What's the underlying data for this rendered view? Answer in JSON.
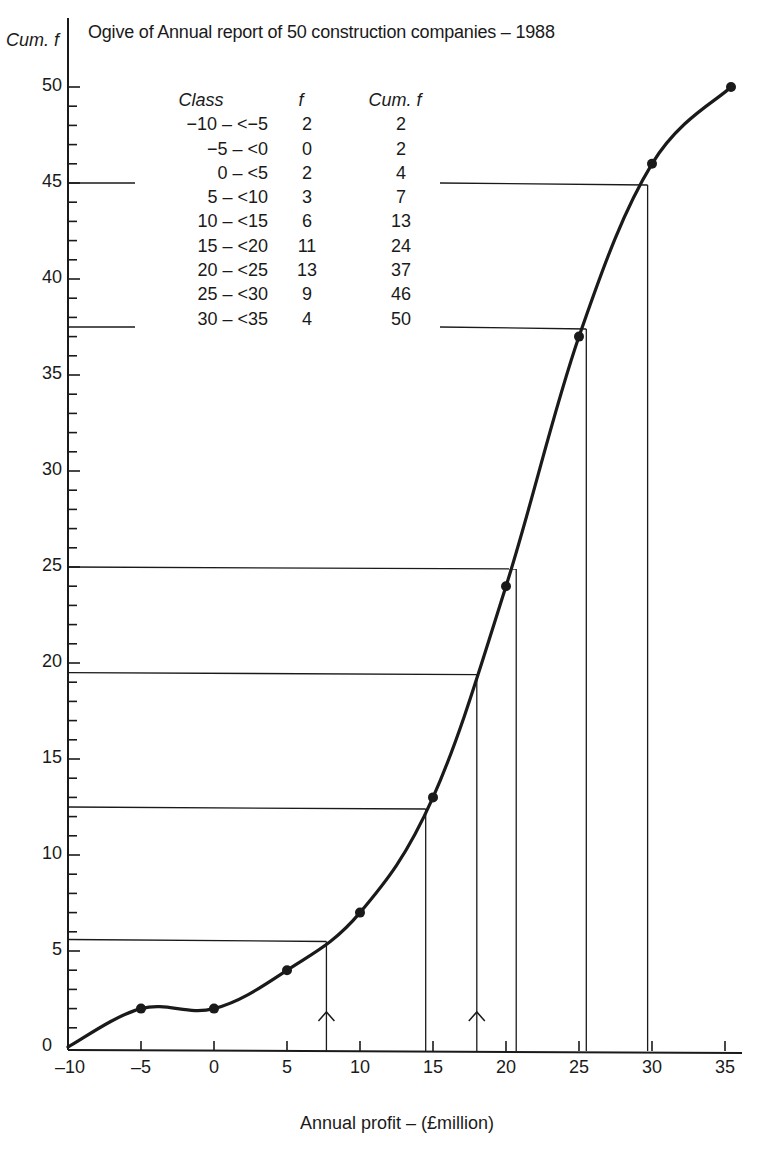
{
  "chart_data": {
    "type": "line",
    "title": "Ogive of Annual report of 50 construction companies – 1988",
    "xlabel": "Annual profit – (£million)",
    "ylabel": "Cum. f",
    "xlim": [
      -10,
      37
    ],
    "ylim": [
      0,
      50
    ],
    "x_ticks": [
      "-10",
      "-5",
      "0",
      "5",
      "10",
      "15",
      "20",
      "25",
      "30",
      "35"
    ],
    "y_ticks": [
      "0",
      "5",
      "10",
      "15",
      "20",
      "25",
      "30",
      "35",
      "40",
      "45",
      "50"
    ],
    "y_minor_tick_step": 1,
    "grid": false,
    "legend": null,
    "series": [
      {
        "name": "Cumulative frequency (ogive)",
        "x": [
          -10,
          -5,
          0,
          5,
          10,
          15,
          20,
          25,
          30,
          35
        ],
        "values": [
          0,
          2,
          2,
          4,
          7,
          13,
          24,
          37,
          46,
          50
        ]
      }
    ],
    "guide_lines": [
      {
        "cum_f": 5.6,
        "profit": 7.7,
        "arrow": true
      },
      {
        "cum_f": 12.5,
        "profit": 14.5,
        "arrow": false
      },
      {
        "cum_f": 19.5,
        "profit": 18.0,
        "arrow": true
      },
      {
        "cum_f": 25,
        "profit": 20.7,
        "arrow": false
      },
      {
        "cum_f": 37.5,
        "profit": 25.5,
        "arrow": false
      },
      {
        "cum_f": 45,
        "profit": 29.7,
        "arrow": false
      }
    ],
    "table": {
      "headers": [
        "Class",
        "f",
        "Cum. f"
      ],
      "rows": [
        [
          "−10 – <−5",
          "2",
          "2"
        ],
        [
          "−5 – <0",
          "0",
          "2"
        ],
        [
          "0 – <5",
          "2",
          "4"
        ],
        [
          "5 – <10",
          "3",
          "7"
        ],
        [
          "10 – <15",
          "6",
          "13"
        ],
        [
          "15 – <20",
          "11",
          "24"
        ],
        [
          "20 – <25",
          "13",
          "37"
        ],
        [
          "25 – <30",
          "9",
          "46"
        ],
        [
          "30 – <35",
          "4",
          "50"
        ]
      ]
    }
  },
  "colors": {
    "ink": "#1a1a1a",
    "background": "#ffffff"
  }
}
